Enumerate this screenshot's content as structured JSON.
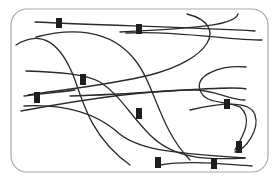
{
  "diagram": {
    "type": "fiber-network",
    "frame": {
      "x": 11,
      "y": 9,
      "width": 257,
      "height": 163,
      "radius": 16,
      "stroke": "#a8a8a8"
    },
    "fiber_color": "#2a2a2a",
    "marker_color": "#1e1e1e",
    "fibers": [
      {
        "id": "f1",
        "d": "M35,22 C100,25 200,28 255,31"
      },
      {
        "id": "f2",
        "d": "M36,37 C70,28 110,28 135,60 C155,85 160,130 190,160"
      },
      {
        "id": "f3",
        "d": "M126,33 C170,30 230,40 262,40"
      },
      {
        "id": "f4",
        "d": "M16,45 C40,30 60,40 75,80 C85,110 95,140 130,165"
      },
      {
        "id": "f5",
        "d": "M187,14 C230,25 210,60 150,75 C110,85 60,90 28,95"
      },
      {
        "id": "f6",
        "d": "M238,14 C235,25 200,28 120,32"
      },
      {
        "id": "f7",
        "d": "M26,71 C60,72 85,74 100,82 C120,95 130,115 150,135 C175,160 210,160 245,158"
      },
      {
        "id": "f8",
        "d": "M21,111 C80,100 150,90 195,90 C215,90 230,100 245,100"
      },
      {
        "id": "f9",
        "d": "M246,67 C220,65 195,75 200,90 C205,105 225,100 240,107 C255,120 240,140 235,150"
      },
      {
        "id": "f10",
        "d": "M246,89 C230,85 150,94 70,96"
      },
      {
        "id": "f11",
        "d": "M24,96 C40,94 60,92 75,90"
      },
      {
        "id": "f12",
        "d": "M24,106 C60,104 90,110 115,130 C135,150 170,153 245,158"
      },
      {
        "id": "f13",
        "d": "M190,110 C220,103 250,100 255,115 C260,130 245,150 235,152"
      },
      {
        "id": "f14",
        "d": "M160,165 C190,160 220,164 252,166"
      }
    ],
    "markers": [
      {
        "id": "m1",
        "x": 56,
        "y": 18,
        "w": 6,
        "h": 10
      },
      {
        "id": "m2",
        "x": 136,
        "y": 24,
        "w": 6,
        "h": 10
      },
      {
        "id": "m3",
        "x": 80,
        "y": 74,
        "w": 6,
        "h": 11
      },
      {
        "id": "m4",
        "x": 34,
        "y": 92,
        "w": 6,
        "h": 11
      },
      {
        "id": "m5",
        "x": 136,
        "y": 108,
        "w": 6,
        "h": 11
      },
      {
        "id": "m6",
        "x": 224,
        "y": 99,
        "w": 6,
        "h": 10
      },
      {
        "id": "m7",
        "x": 155,
        "y": 157,
        "w": 6,
        "h": 11
      },
      {
        "id": "m8",
        "x": 211,
        "y": 158,
        "w": 6,
        "h": 11
      },
      {
        "id": "m9",
        "x": 236,
        "y": 141,
        "w": 6,
        "h": 12
      }
    ]
  }
}
